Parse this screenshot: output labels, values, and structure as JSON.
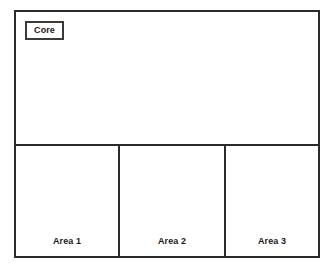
{
  "diagram": {
    "type": "block-diagram",
    "title": "",
    "background_color": "#ffffff",
    "line_color": "#2b2b2b",
    "text_color": "#1a1a1a",
    "core": {
      "label": "Core",
      "label_boxed": true
    },
    "areas": [
      {
        "label": "Area 1"
      },
      {
        "label": "Area 2"
      },
      {
        "label": "Area 3"
      }
    ]
  }
}
